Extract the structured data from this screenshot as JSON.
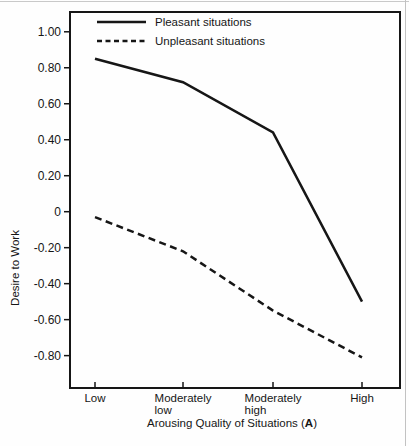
{
  "figure": {
    "ylabel": "Desire to Work",
    "xlabel_prefix": "Arousing Quality of Situations (",
    "xlabel_bold": "A",
    "xlabel_suffix": ")"
  },
  "chart_data": {
    "type": "line",
    "title": "",
    "xlabel": "Arousing Quality of Situations (A)",
    "ylabel": "Desire to Work",
    "categories": [
      "Low",
      "Moderately low",
      "Moderately high",
      "High"
    ],
    "category_label_lines": [
      [
        "Low"
      ],
      [
        "Moderately",
        "low"
      ],
      [
        "Moderately",
        "high"
      ],
      [
        "High"
      ]
    ],
    "y_tick_values": [
      1.0,
      0.8,
      0.6,
      0.4,
      0.2,
      0,
      -0.2,
      -0.4,
      -0.6,
      -0.8
    ],
    "y_tick_labels": [
      "1.00",
      "0.80",
      "0.60",
      "0.40",
      "0.20",
      "0",
      "-0.20",
      "-0.40",
      "-0.60",
      "-0.80"
    ],
    "ylim": [
      -0.98,
      1.11
    ],
    "grid": false,
    "legend_position": "top-left-inside",
    "line_color": "#161616",
    "series": [
      {
        "name": "Pleasant situations",
        "line_style": "solid",
        "values": [
          0.85,
          0.72,
          0.44,
          -0.5
        ]
      },
      {
        "name": "Unpleasant situations",
        "line_style": "dashed",
        "values": [
          -0.03,
          -0.22,
          -0.55,
          -0.81
        ]
      }
    ]
  }
}
